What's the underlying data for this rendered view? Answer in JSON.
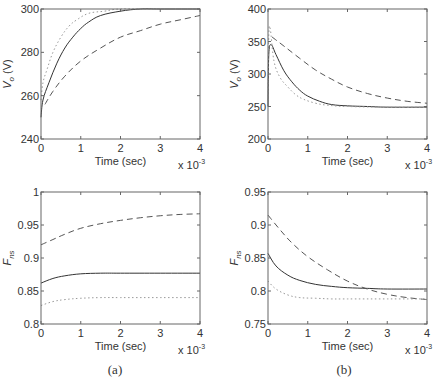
{
  "chart_data": [
    {
      "panel": "a-top",
      "type": "line",
      "xlabel": "Time (sec)",
      "x_multiplier": "x 10^-3",
      "ylabel": "V_o (V)",
      "xlim": [
        0,
        4
      ],
      "ylim": [
        240,
        300
      ],
      "xticks": [
        0,
        1,
        2,
        3,
        4
      ],
      "yticks": [
        240,
        260,
        280,
        300
      ],
      "grid": false,
      "series": [
        {
          "name": "solid",
          "style": "solid",
          "x": [
            0,
            0.05,
            0.2,
            0.4,
            0.6,
            0.8,
            1.0,
            1.2,
            1.5,
            2.0,
            2.5,
            3.0,
            4.0
          ],
          "y": [
            250,
            258,
            266,
            275,
            282,
            287,
            291,
            294,
            297,
            299,
            300,
            300,
            300
          ]
        },
        {
          "name": "dashed",
          "style": "dashed",
          "x": [
            0.1,
            0.3,
            0.6,
            1.0,
            1.5,
            2.0,
            2.5,
            3.0,
            3.5,
            4.0
          ],
          "y": [
            256,
            262,
            269,
            276,
            282,
            287,
            290,
            293,
            295,
            297
          ]
        },
        {
          "name": "dotted",
          "style": "dotted",
          "x": [
            0,
            0.05,
            0.15,
            0.3,
            0.5,
            0.7,
            0.9,
            1.2,
            1.6,
            2.0,
            3.0,
            4.0
          ],
          "y": [
            258,
            266,
            272,
            280,
            287,
            292,
            295,
            298,
            299,
            300,
            300,
            300
          ]
        }
      ]
    },
    {
      "panel": "b-top",
      "type": "line",
      "xlabel": "Time (sec)",
      "x_multiplier": "x 10^-3",
      "ylabel": "V_o (V)",
      "xlim": [
        0,
        4
      ],
      "ylim": [
        200,
        400
      ],
      "xticks": [
        0,
        1,
        2,
        3,
        4
      ],
      "yticks": [
        200,
        250,
        300,
        350,
        400
      ],
      "grid": false,
      "series": [
        {
          "name": "solid",
          "style": "solid",
          "x": [
            0,
            0.02,
            0.08,
            0.2,
            0.4,
            0.6,
            0.8,
            1.0,
            1.3,
            1.6,
            2.0,
            2.5,
            3.0,
            4.0
          ],
          "y": [
            250,
            330,
            345,
            330,
            305,
            288,
            275,
            266,
            258,
            253,
            251,
            250,
            249,
            249
          ]
        },
        {
          "name": "dashed",
          "style": "dashed",
          "x": [
            0.1,
            0.4,
            0.8,
            1.2,
            1.6,
            2.0,
            2.5,
            3.0,
            3.5,
            4.0
          ],
          "y": [
            357,
            343,
            324,
            306,
            292,
            280,
            270,
            263,
            258,
            255
          ]
        },
        {
          "name": "dotted",
          "style": "dotted",
          "x": [
            0,
            0.02,
            0.06,
            0.15,
            0.3,
            0.5,
            0.7,
            0.9,
            1.2,
            1.5,
            2.0,
            3.0,
            4.0
          ],
          "y": [
            260,
            360,
            368,
            320,
            295,
            280,
            268,
            261,
            255,
            252,
            250,
            249,
            249
          ]
        }
      ]
    },
    {
      "panel": "a-bottom",
      "type": "line",
      "xlabel": "Time (sec)",
      "x_multiplier": "x 10^-3",
      "ylabel": "F_ns",
      "xlim": [
        0,
        4
      ],
      "ylim": [
        0.8,
        1.0
      ],
      "xticks": [
        0,
        1,
        2,
        3,
        4
      ],
      "yticks": [
        0.8,
        0.85,
        0.9,
        0.95,
        1.0
      ],
      "grid": false,
      "series": [
        {
          "name": "solid",
          "style": "solid",
          "x": [
            0,
            0.3,
            0.6,
            1.0,
            1.5,
            2.0,
            3.0,
            4.0
          ],
          "y": [
            0.862,
            0.869,
            0.873,
            0.876,
            0.877,
            0.877,
            0.877,
            0.877
          ]
        },
        {
          "name": "dashed",
          "style": "dashed",
          "x": [
            0,
            0.3,
            0.6,
            1.0,
            1.5,
            2.0,
            2.5,
            3.0,
            3.5,
            4.0
          ],
          "y": [
            0.92,
            0.928,
            0.936,
            0.945,
            0.952,
            0.957,
            0.961,
            0.964,
            0.966,
            0.967
          ]
        },
        {
          "name": "dotted",
          "style": "dotted",
          "x": [
            0,
            0.3,
            0.6,
            1.0,
            1.5,
            2.0,
            3.0,
            4.0
          ],
          "y": [
            0.828,
            0.834,
            0.837,
            0.839,
            0.84,
            0.84,
            0.84,
            0.84
          ]
        }
      ]
    },
    {
      "panel": "b-bottom",
      "type": "line",
      "xlabel": "Time (sec)",
      "x_multiplier": "x 10^-3",
      "ylabel": "F_ns",
      "xlim": [
        0,
        4
      ],
      "ylim": [
        0.75,
        0.95
      ],
      "xticks": [
        0,
        1,
        2,
        3,
        4
      ],
      "yticks": [
        0.75,
        0.8,
        0.85,
        0.9,
        0.95
      ],
      "grid": false,
      "series": [
        {
          "name": "solid",
          "style": "solid",
          "x": [
            0,
            0.2,
            0.5,
            0.8,
            1.2,
            1.6,
            2.0,
            2.5,
            3.0,
            4.0
          ],
          "y": [
            0.857,
            0.838,
            0.824,
            0.816,
            0.81,
            0.807,
            0.805,
            0.804,
            0.803,
            0.803
          ]
        },
        {
          "name": "dashed",
          "style": "dashed",
          "x": [
            0,
            0.3,
            0.6,
            1.0,
            1.5,
            2.0,
            2.5,
            3.0,
            3.5,
            4.0
          ],
          "y": [
            0.915,
            0.893,
            0.873,
            0.852,
            0.832,
            0.815,
            0.803,
            0.795,
            0.79,
            0.787
          ]
        },
        {
          "name": "dotted",
          "style": "dotted",
          "x": [
            0,
            0.2,
            0.5,
            0.8,
            1.2,
            1.6,
            2.0,
            3.0,
            4.0
          ],
          "y": [
            0.815,
            0.803,
            0.794,
            0.79,
            0.789,
            0.788,
            0.788,
            0.788,
            0.788
          ]
        }
      ]
    }
  ],
  "captions": {
    "a": "(a)",
    "b": "(b)"
  },
  "labels": {
    "xlabel": "Time (sec)",
    "x_multiplier_base": "x 10",
    "x_multiplier_exp": "-3",
    "vo_main": "V",
    "vo_sub": "o",
    "vo_unit": " (V)",
    "fns_main": "F",
    "fns_sub": "ns"
  }
}
